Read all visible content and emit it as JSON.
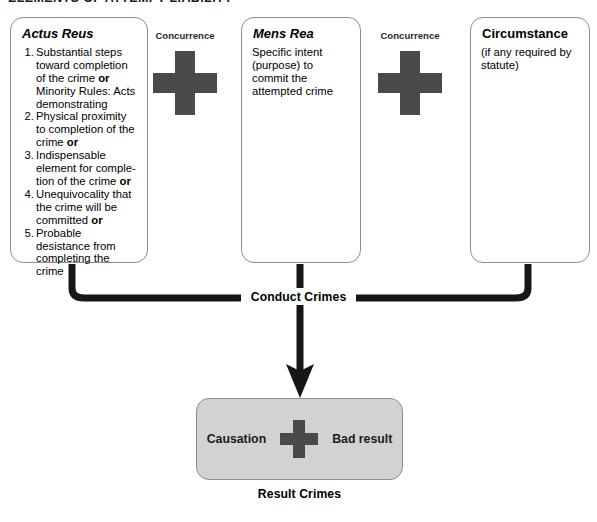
{
  "heading": "ELEMENTS OF ATTEMPT LIABILITY",
  "boxes": {
    "actus_reus": {
      "title": "Actus Reus",
      "rules": [
        {
          "num": "1.",
          "lines": [
            "Substantial steps",
            "toward completion",
            "of the crime ",
            "or",
            "Minority Rules: Acts",
            "demonstrating"
          ]
        },
        {
          "num": "2.",
          "lines": [
            "Physical proximity to",
            "completion of the",
            "crime ",
            "or"
          ]
        },
        {
          "num": "3.",
          "lines": [
            "Indispensable",
            "element for comple-",
            "tion of the crime ",
            "or"
          ]
        },
        {
          "num": "4.",
          "lines": [
            "Unequivocality that",
            "the crime will be",
            "committed ",
            "or"
          ]
        },
        {
          "num": "5.",
          "lines": [
            "Probable desistance",
            "from completing",
            "the crime"
          ]
        }
      ]
    },
    "mens_rea": {
      "title": "Mens Rea",
      "body": "Specific intent (purpose) to commit the attempted crime"
    },
    "circumstance": {
      "title": "Circumstance",
      "body": "(if any required by statute)"
    }
  },
  "concurrence": {
    "left_label": "Concurrence",
    "right_label": "Concurrence",
    "symbol": "plus-sign"
  },
  "conduct": {
    "label": "Conduct Crimes"
  },
  "result": {
    "causation_label": "Causation",
    "symbol": "plus-sign",
    "bad_result_label": "Bad result",
    "caption": "Result Crimes"
  },
  "colors": {
    "plus_gray": "#4a4a4a",
    "result_box_fill": "#d2d2d2",
    "box_border": "#8d8d8d",
    "connector": "#161616"
  }
}
